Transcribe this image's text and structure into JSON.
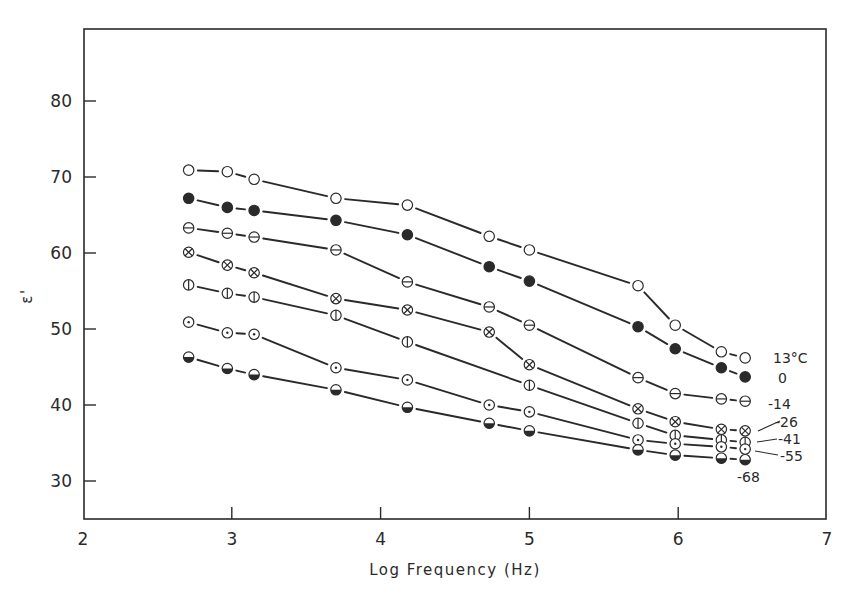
{
  "chart_data": {
    "type": "line",
    "title": "",
    "xlabel": "Log Frequency (Hz)",
    "ylabel": "ε'",
    "xlim": [
      2,
      7
    ],
    "ylim": [
      25,
      89
    ],
    "xticks": [
      2,
      3,
      4,
      5,
      6,
      7
    ],
    "yticks": [
      30,
      40,
      50,
      60,
      70,
      80
    ],
    "grid": false,
    "legend_position": "inline labels at right end of curves",
    "series": [
      {
        "name": "13°C",
        "label": "13°C",
        "marker": "open-circle",
        "x": [
          2.71,
          2.97,
          3.15,
          3.7,
          4.18,
          4.73,
          5.0,
          5.73,
          5.98,
          6.29,
          6.45
        ],
        "values": [
          70.9,
          70.7,
          69.7,
          67.2,
          66.3,
          62.2,
          60.4,
          55.7,
          50.5,
          47.0,
          46.2
        ]
      },
      {
        "name": "0",
        "label": "0",
        "marker": "filled-circle",
        "x": [
          2.71,
          2.97,
          3.15,
          3.7,
          4.18,
          4.73,
          5.0,
          5.73,
          5.98,
          6.29,
          6.45
        ],
        "values": [
          67.2,
          66.0,
          65.6,
          64.3,
          62.4,
          58.2,
          56.3,
          50.3,
          47.4,
          44.9,
          43.7
        ]
      },
      {
        "name": "-14",
        "label": "-14",
        "marker": "circle-horizontal-bar",
        "x": [
          2.71,
          2.97,
          3.15,
          3.7,
          4.18,
          4.73,
          5.0,
          5.73,
          5.98,
          6.29,
          6.45
        ],
        "values": [
          63.3,
          62.6,
          62.1,
          60.4,
          56.2,
          52.9,
          50.5,
          43.6,
          41.5,
          40.8,
          40.5
        ]
      },
      {
        "name": "-26",
        "label": "-26",
        "marker": "circle-cross",
        "x": [
          2.71,
          2.97,
          3.15,
          3.7,
          4.18,
          4.73,
          5.0,
          5.73,
          5.98,
          6.29,
          6.45
        ],
        "values": [
          60.1,
          58.4,
          57.4,
          54.0,
          52.5,
          49.6,
          45.3,
          39.5,
          37.8,
          36.8,
          36.6
        ]
      },
      {
        "name": "-41",
        "label": "-41",
        "marker": "circle-vertical-bar",
        "x": [
          2.71,
          2.97,
          3.15,
          3.7,
          4.18,
          5.0,
          5.73,
          5.98,
          6.29,
          6.45
        ],
        "values": [
          55.8,
          54.7,
          54.2,
          51.8,
          48.3,
          42.6,
          37.6,
          36.0,
          35.4,
          35.1
        ]
      },
      {
        "name": "-55",
        "label": "-55",
        "marker": "circle-dot",
        "x": [
          2.71,
          2.97,
          3.15,
          3.7,
          4.18,
          4.73,
          5.0,
          5.73,
          5.98,
          6.29,
          6.45
        ],
        "values": [
          50.9,
          49.5,
          49.3,
          44.9,
          43.3,
          40.0,
          39.1,
          35.4,
          34.9,
          34.5,
          34.2
        ]
      },
      {
        "name": "-68",
        "label": "-68",
        "marker": "half-filled-circle",
        "x": [
          2.71,
          2.97,
          3.15,
          3.7,
          4.18,
          4.73,
          5.0,
          5.73,
          5.98,
          6.29,
          6.45
        ],
        "values": [
          46.3,
          44.8,
          44.0,
          42.0,
          39.7,
          37.6,
          36.6,
          34.1,
          33.4,
          33.0,
          32.8
        ]
      }
    ]
  },
  "colors": {
    "ink": "#2a2a2a",
    "background": "#ffffff"
  }
}
